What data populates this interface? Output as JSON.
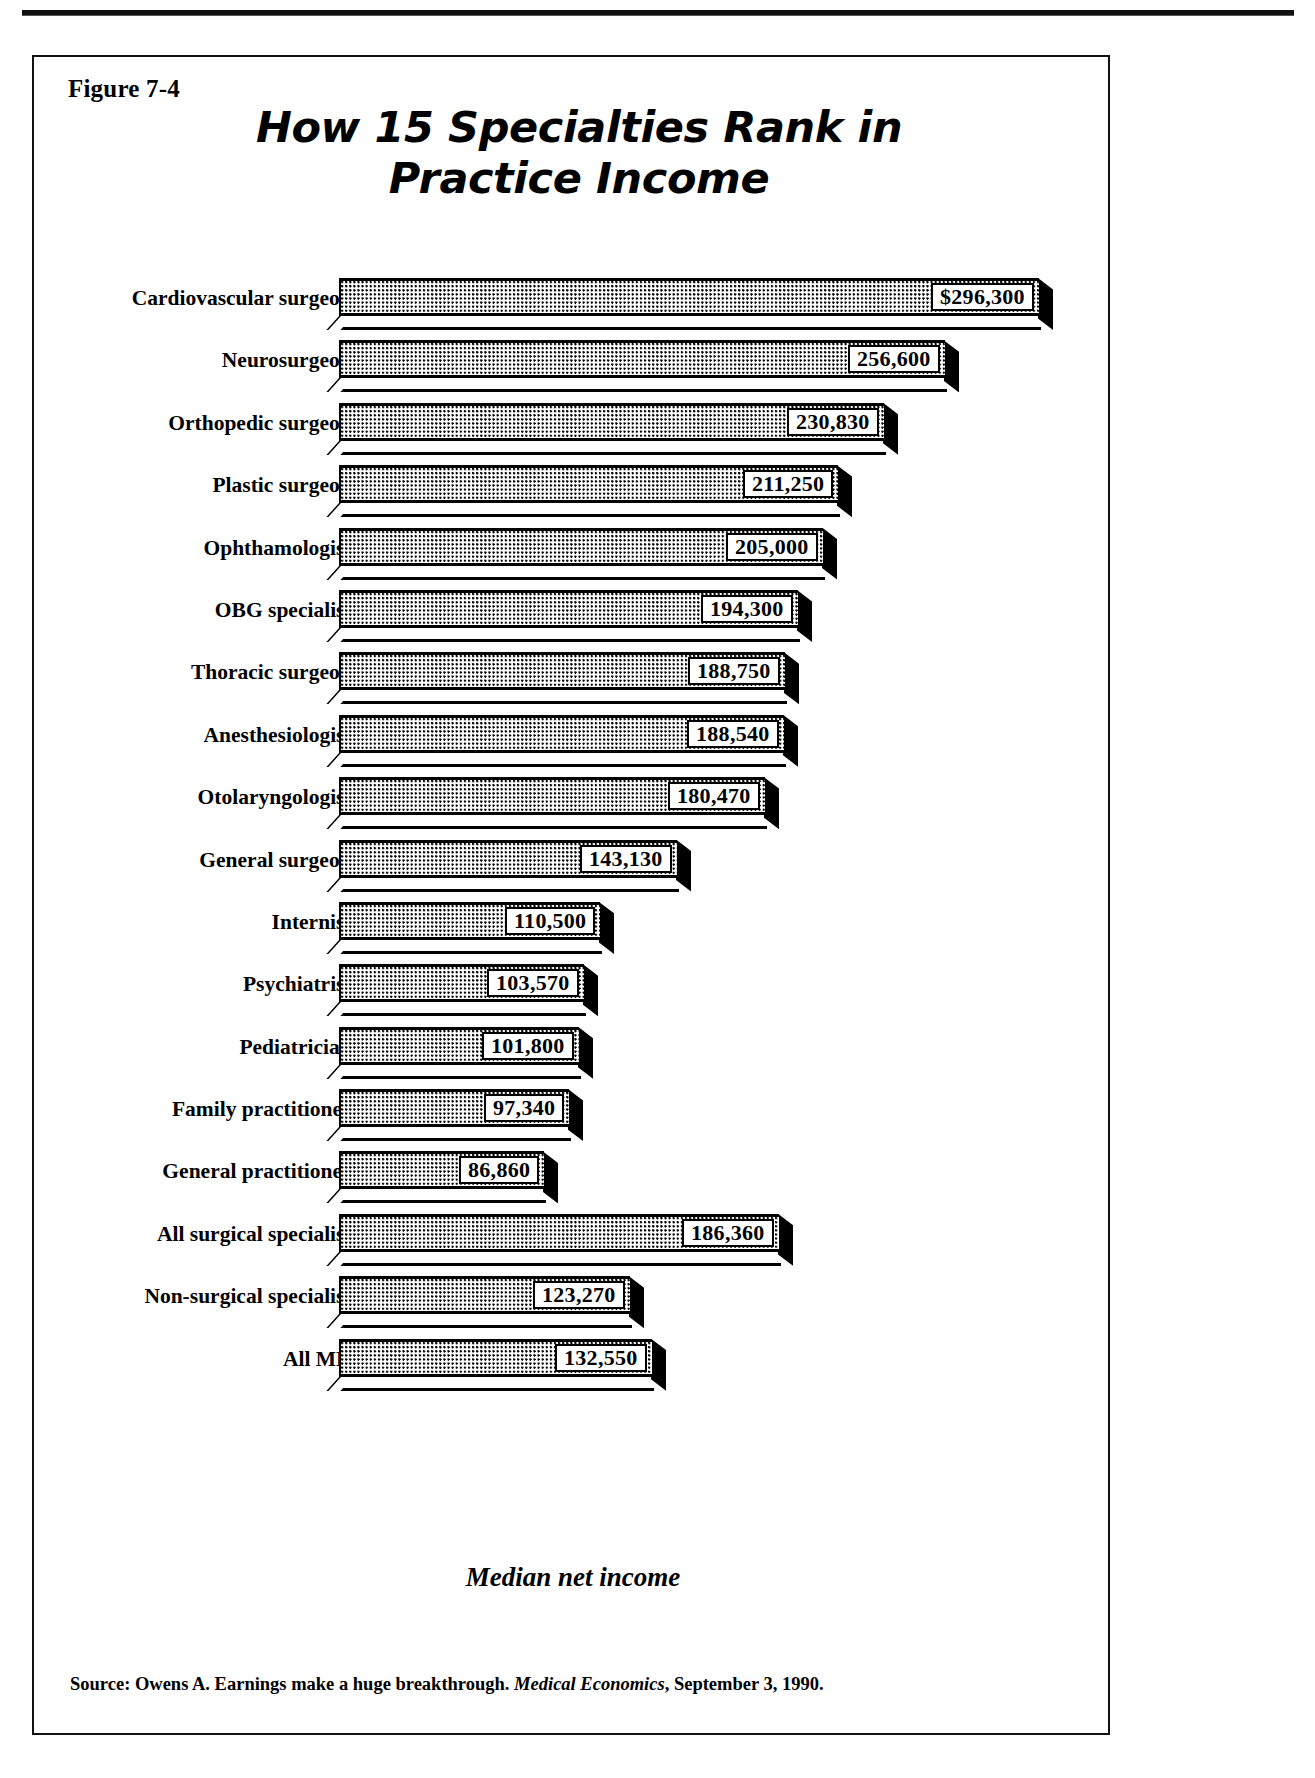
{
  "figure": {
    "label": "Figure 7-4",
    "title_line1": "How 15 Specialties Rank in",
    "title_line2": "Practice Income",
    "axis_caption": "Median net income",
    "source_prefix": "Source: Owens A. Earnings make a huge breakthrough. ",
    "source_journal": "Medical Economics",
    "source_suffix": ", September 3, 1990."
  },
  "chart_data": {
    "type": "bar",
    "orientation": "horizontal",
    "title": "How 15 Specialties Rank in Practice Income",
    "xlabel": "Median net income",
    "ylabel": "",
    "xlim": [
      0,
      296300
    ],
    "grid": false,
    "legend": null,
    "value_unit": "USD",
    "categories": [
      "Cardiovascular surgeons",
      "Neurosurgeons",
      "Orthopedic surgeons",
      "Plastic surgeons",
      "Ophthamologists",
      "OBG specialists",
      "Thoracic  surgeons",
      "Anesthesiologists",
      "Otolaryngologists",
      "General surgeons",
      "Internists",
      "Psychiatrists",
      "Pediatricians",
      "Family practitioners",
      "General practitioners",
      "All surgical specialists",
      "Non-surgical specialists",
      "All MDs"
    ],
    "values": [
      296300,
      256600,
      230830,
      211250,
      205000,
      194300,
      188750,
      188540,
      180470,
      143130,
      110500,
      103570,
      101800,
      97340,
      86860,
      186360,
      123270,
      132550
    ],
    "labels": [
      "$296,300",
      "256,600",
      "230,830",
      "211,250",
      "205,000",
      "194,300",
      "188,750",
      "188,540",
      "180,470",
      "143,130",
      "110,500",
      "103,570",
      "101,800",
      "97,340",
      "86,860",
      "186,360",
      "123,270",
      "132,550"
    ]
  },
  "style": {
    "ink": "#000000",
    "paper": "#ffffff"
  }
}
